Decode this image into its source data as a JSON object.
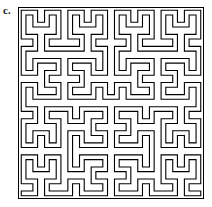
{
  "figure": {
    "label": "c.",
    "caption_letter": "c.",
    "title": "",
    "kind": "space-filling-curve-diagram"
  },
  "panel": {
    "name": "hilbert-curve-panel",
    "frame": {
      "x": 18,
      "y": 7,
      "width": 186,
      "height": 192,
      "stroke_color": "#000000",
      "stroke_width": 1,
      "fill_color": "#ffffff"
    }
  },
  "chart_data": {
    "type": "line",
    "subtitle": "",
    "xlabel": "",
    "ylabel": "",
    "grid": false,
    "legend": null,
    "curve": {
      "family": "hilbert",
      "order": 4,
      "grid_cells": 16,
      "cell_size": 11.25,
      "ribbon_width": 3.6,
      "ribbon_fill": "#ffffff",
      "ribbon_outline": "#000000",
      "outline_width": 1.1,
      "start_corner": "bottom-left",
      "end_corner": "bottom-right",
      "inset": 5.6
    },
    "xlim": [
      0,
      16
    ],
    "ylim": [
      0,
      16
    ]
  },
  "colors": {
    "ink": "#000000",
    "paper": "#ffffff",
    "label_ink": "#1a1a1a"
  }
}
